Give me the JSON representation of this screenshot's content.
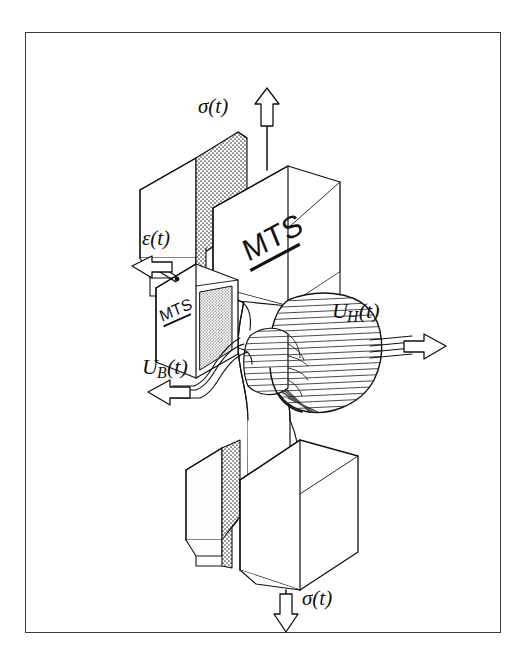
{
  "figure": {
    "caption_labels": {
      "stress_top": "σ(t)",
      "stress_bottom": "σ(t)",
      "strain": "ε(t)",
      "u_h_main": "U",
      "u_h_sub": "H",
      "u_h_tail": "(t)",
      "u_b_main": "U",
      "u_b_sub": "B",
      "u_b_tail": "(t)"
    },
    "brand_marks": {
      "upper_grip_logo": "MTS",
      "extensometer_logo": "MTS"
    },
    "colors": {
      "ink": "#111111",
      "frame": "#3a3a3a",
      "paper": "#ffffff",
      "hatch": "#2a2a2a",
      "stipple": "#4a4a4a",
      "face_light": "#fdfdfd",
      "face_shade": "#efefef"
    },
    "components": [
      "upper-wedge-grip",
      "lower-wedge-grip",
      "dogbone-specimen",
      "extensometer",
      "induction-coil-winding",
      "coil-lead-wires"
    ]
  }
}
